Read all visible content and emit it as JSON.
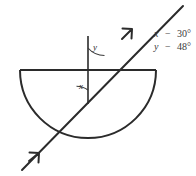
{
  "figure": {
    "type": "optics-refraction-diagram",
    "background_color": "#ffffff",
    "line_color": "#2b2b2b"
  },
  "labels": {
    "angle_below": "x",
    "angle_above": "y"
  },
  "values": {
    "line1": {
      "variable": "x",
      "separator": "−",
      "value": "30°",
      "full": "x − 30°"
    },
    "line2": {
      "variable": "y",
      "separator": "−",
      "value": "48°",
      "full": "y − 48°"
    }
  },
  "geometry": {
    "center_x": 88,
    "center_y": 70,
    "radius": 68,
    "flat_surface_y": 70,
    "flat_surface_x1": 20,
    "flat_surface_x2": 156,
    "normal_top_y": 36,
    "normal_bottom_y": 104,
    "ray_start": [
      22,
      170
    ],
    "ray_end": [
      183,
      6
    ],
    "incident_arrow_at": [
      38,
      154
    ],
    "emergent_arrow_at": [
      131,
      30
    ]
  },
  "elements": {
    "semicircle_block": "semicircular-glass-block",
    "flat_surface": "flat-surface-line",
    "normal_line": "normal-line",
    "light_ray": "light-ray-path",
    "incident_arrow": "incident-ray-arrow",
    "emergent_arrow": "emergent-ray-arrow",
    "arc_below": "angle-arc-x",
    "arc_above": "angle-arc-y"
  }
}
